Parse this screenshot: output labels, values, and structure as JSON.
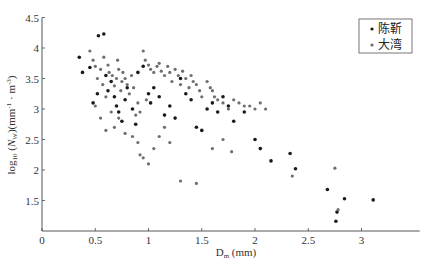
{
  "chart_data": {
    "type": "scatter",
    "title": "",
    "xlabel": "D_m (mm)",
    "ylabel": "log10 (N_W)(mm^-1 · m^-3)",
    "xlabel_main": "D",
    "xlabel_sub": "m",
    "xlabel_rest": " (mm)",
    "ylabel_parts": {
      "pre": "log",
      "sub1": "10",
      "mid": " (",
      "italic": "N",
      "sub2": "W",
      "post": ")(mm",
      "sup1": "-1",
      "dot": " · m",
      "sup2": "-3",
      "end": ")"
    },
    "xlim": [
      0,
      3.5
    ],
    "ylim": [
      1,
      4.5
    ],
    "xticks": [
      0,
      0.5,
      1,
      1.5,
      2,
      2.5,
      3
    ],
    "xtick_labels": [
      "0",
      "0.5",
      "1",
      "1.5",
      "2",
      "2.5",
      "3"
    ],
    "yticks": [
      1.5,
      2,
      2.5,
      3,
      3.5,
      4,
      4.5
    ],
    "ytick_labels": [
      "1.5",
      "2",
      "2.5",
      "3",
      "3.5",
      "4",
      "4.5"
    ],
    "grid": false,
    "legend_position": "upper right",
    "series": [
      {
        "name": "陈靳",
        "color": "#1a1a1a",
        "points": [
          [
            0.35,
            3.85
          ],
          [
            0.38,
            3.6
          ],
          [
            0.45,
            3.68
          ],
          [
            0.53,
            4.2
          ],
          [
            0.58,
            4.23
          ],
          [
            0.48,
            3.1
          ],
          [
            0.52,
            3.25
          ],
          [
            0.6,
            3.55
          ],
          [
            0.62,
            3.3
          ],
          [
            0.65,
            3.45
          ],
          [
            0.68,
            3.2
          ],
          [
            0.7,
            3.05
          ],
          [
            0.72,
            2.95
          ],
          [
            0.75,
            2.8
          ],
          [
            0.78,
            3.15
          ],
          [
            0.8,
            3.35
          ],
          [
            0.85,
            3.0
          ],
          [
            0.88,
            2.75
          ],
          [
            0.9,
            3.6
          ],
          [
            0.95,
            3.7
          ],
          [
            1.0,
            3.25
          ],
          [
            1.02,
            3.1
          ],
          [
            1.05,
            3.35
          ],
          [
            1.1,
            3.2
          ],
          [
            1.15,
            2.9
          ],
          [
            1.2,
            3.05
          ],
          [
            1.25,
            2.85
          ],
          [
            1.3,
            3.5
          ],
          [
            1.35,
            3.25
          ],
          [
            1.4,
            3.15
          ],
          [
            1.45,
            2.7
          ],
          [
            1.5,
            2.65
          ],
          [
            1.55,
            3.0
          ],
          [
            1.6,
            3.1
          ],
          [
            1.65,
            2.95
          ],
          [
            1.7,
            3.2
          ],
          [
            1.75,
            3.05
          ],
          [
            1.8,
            2.8
          ],
          [
            1.9,
            2.95
          ],
          [
            2.0,
            2.5
          ],
          [
            2.05,
            2.35
          ],
          [
            2.15,
            2.15
          ],
          [
            2.33,
            2.27
          ],
          [
            2.38,
            2.02
          ],
          [
            2.68,
            1.68
          ],
          [
            2.77,
            1.31
          ],
          [
            2.76,
            1.16
          ],
          [
            2.84,
            1.53
          ],
          [
            3.11,
            1.51
          ]
        ]
      },
      {
        "name": "大湾",
        "color": "#6e6e6e",
        "points": [
          [
            0.45,
            3.95
          ],
          [
            0.48,
            3.8
          ],
          [
            0.5,
            3.7
          ],
          [
            0.52,
            3.5
          ],
          [
            0.55,
            3.65
          ],
          [
            0.57,
            3.4
          ],
          [
            0.58,
            3.85
          ],
          [
            0.6,
            3.2
          ],
          [
            0.62,
            3.72
          ],
          [
            0.63,
            3.6
          ],
          [
            0.65,
            2.95
          ],
          [
            0.66,
            3.55
          ],
          [
            0.68,
            3.38
          ],
          [
            0.7,
            3.5
          ],
          [
            0.71,
            3.8
          ],
          [
            0.72,
            3.65
          ],
          [
            0.74,
            3.3
          ],
          [
            0.75,
            3.45
          ],
          [
            0.76,
            3.6
          ],
          [
            0.78,
            3.5
          ],
          [
            0.8,
            3.4
          ],
          [
            0.82,
            3.25
          ],
          [
            0.84,
            3.55
          ],
          [
            0.86,
            3.35
          ],
          [
            0.5,
            3.05
          ],
          [
            0.55,
            2.85
          ],
          [
            0.6,
            2.65
          ],
          [
            0.68,
            2.7
          ],
          [
            0.72,
            2.85
          ],
          [
            0.78,
            2.6
          ],
          [
            0.85,
            2.55
          ],
          [
            0.9,
            2.45
          ],
          [
            0.92,
            2.25
          ],
          [
            0.95,
            2.2
          ],
          [
            1.0,
            2.1
          ],
          [
            1.05,
            2.35
          ],
          [
            1.1,
            2.55
          ],
          [
            0.95,
            3.95
          ],
          [
            0.97,
            3.8
          ],
          [
            1.0,
            3.72
          ],
          [
            1.02,
            3.65
          ],
          [
            1.05,
            3.6
          ],
          [
            1.08,
            3.7
          ],
          [
            1.1,
            3.75
          ],
          [
            1.12,
            3.62
          ],
          [
            1.15,
            3.55
          ],
          [
            1.18,
            3.7
          ],
          [
            1.2,
            3.6
          ],
          [
            1.22,
            3.45
          ],
          [
            1.25,
            3.65
          ],
          [
            1.28,
            3.55
          ],
          [
            1.3,
            3.4
          ],
          [
            1.32,
            3.62
          ],
          [
            1.35,
            3.5
          ],
          [
            1.38,
            3.35
          ],
          [
            1.4,
            3.55
          ],
          [
            1.42,
            3.45
          ],
          [
            1.45,
            3.4
          ],
          [
            1.48,
            3.3
          ],
          [
            1.5,
            3.2
          ],
          [
            1.55,
            3.45
          ],
          [
            1.58,
            3.35
          ],
          [
            1.6,
            3.3
          ],
          [
            1.62,
            3.2
          ],
          [
            1.65,
            3.15
          ],
          [
            1.7,
            3.1
          ],
          [
            1.75,
            3.0
          ],
          [
            1.8,
            3.15
          ],
          [
            1.85,
            3.1
          ],
          [
            1.9,
            3.05
          ],
          [
            1.95,
            3.05
          ],
          [
            2.0,
            3.0
          ],
          [
            2.05,
            3.1
          ],
          [
            2.1,
            3.0
          ],
          [
            1.3,
            1.82
          ],
          [
            1.45,
            1.78
          ],
          [
            1.6,
            2.35
          ],
          [
            1.7,
            2.5
          ],
          [
            1.78,
            2.3
          ],
          [
            1.15,
            2.7
          ],
          [
            1.2,
            2.45
          ],
          [
            0.88,
            2.9
          ],
          [
            0.9,
            3.1
          ],
          [
            0.92,
            2.95
          ],
          [
            0.98,
            3.15
          ],
          [
            2.75,
            2.03
          ],
          [
            2.78,
            1.35
          ],
          [
            2.35,
            1.9
          ]
        ]
      }
    ]
  },
  "legend": {
    "items": [
      {
        "label": "陈靳",
        "marker_color": "#1a1a1a"
      },
      {
        "label": "大湾",
        "marker_color": "#6e6e6e"
      }
    ]
  }
}
